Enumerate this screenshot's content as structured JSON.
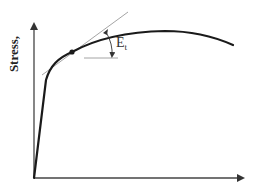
{
  "diagram": {
    "type": "stress-strain-curve",
    "y_axis": {
      "label": "Stress,"
    },
    "x_axis": {
      "label": ""
    },
    "annotation": {
      "symbol": "E",
      "subscript": "t",
      "meaning": "tangent modulus"
    },
    "colors": {
      "curve": "#1a1a1a",
      "axes": "#444444",
      "tangent": "#9a9a9a",
      "reference_line": "#9a9a9a",
      "background": "#ffffff"
    },
    "elements": {
      "curve_start": [
        34,
        178
      ],
      "tangent_point": [
        72,
        52
      ],
      "curve_end": [
        233,
        45
      ]
    }
  }
}
